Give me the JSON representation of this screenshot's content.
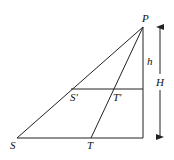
{
  "diagram": {
    "type": "geometry-similar-triangles",
    "points": {
      "P": {
        "label": "P",
        "x": 143,
        "y": 27
      },
      "S": {
        "label": "S",
        "x": 17,
        "y": 138
      },
      "T": {
        "label": "T",
        "x": 91,
        "y": 138
      },
      "S_prime": {
        "label": "S′",
        "x": 71,
        "y": 89
      },
      "T_prime": {
        "label": "T′",
        "x": 113,
        "y": 89
      },
      "foot_bottom": {
        "x": 143,
        "y": 138
      },
      "foot_mid": {
        "x": 143,
        "y": 89
      }
    },
    "labels": {
      "P": "P",
      "S": "S",
      "T": "T",
      "S_prime": "S′",
      "T_prime": "T′",
      "h": "h",
      "H": "H"
    },
    "colors": {
      "line": "#222222",
      "text": "#111111",
      "background": "#ffffff"
    }
  }
}
